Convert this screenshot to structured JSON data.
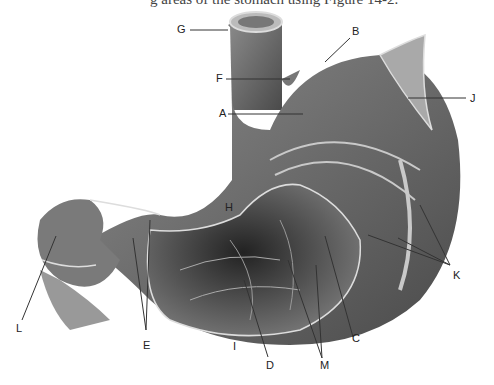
{
  "caption": "g areas of the stomach using Figure 14-2.",
  "figure": {
    "labels": [
      {
        "id": "A",
        "x": 219,
        "y": 112
      },
      {
        "id": "B",
        "x": 352,
        "y": 27
      },
      {
        "id": "C",
        "x": 352,
        "y": 335
      },
      {
        "id": "D",
        "x": 266,
        "y": 362
      },
      {
        "id": "E",
        "x": 143,
        "y": 342
      },
      {
        "id": "F",
        "x": 216,
        "y": 75
      },
      {
        "id": "G",
        "x": 177,
        "y": 26
      },
      {
        "id": "H",
        "x": 224,
        "y": 205
      },
      {
        "id": "I",
        "x": 232,
        "y": 343
      },
      {
        "id": "J",
        "x": 470,
        "y": 98
      },
      {
        "id": "K",
        "x": 453,
        "y": 273
      },
      {
        "id": "L",
        "x": 16,
        "y": 326
      },
      {
        "id": "M",
        "x": 320,
        "y": 362
      }
    ]
  }
}
